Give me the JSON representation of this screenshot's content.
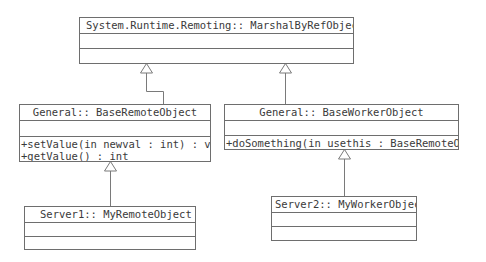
{
  "diagram": {
    "type": "uml-class-diagram",
    "classes": [
      {
        "id": "marshal",
        "name": "System.Runtime.Remoting:: MarshalByRefObject",
        "attributes": [],
        "operations": []
      },
      {
        "id": "base_remote",
        "name": "General:: BaseRemoteObject",
        "attributes": [],
        "operations": [
          "+setValue(in newval : int) : void",
          "+getValue() : int"
        ]
      },
      {
        "id": "base_worker",
        "name": "General:: BaseWorkerObject",
        "attributes": [],
        "operations": [
          "+doSomething(in usethis : BaseRemoteObject)"
        ]
      },
      {
        "id": "my_remote",
        "name": "Server1:: MyRemoteObject",
        "attributes": [],
        "operations": []
      },
      {
        "id": "my_worker",
        "name": "Server2:: MyWorkerObject",
        "attributes": [],
        "operations": []
      }
    ],
    "relationships": [
      {
        "type": "generalization",
        "from": "base_remote",
        "to": "marshal"
      },
      {
        "type": "generalization",
        "from": "base_worker",
        "to": "marshal"
      },
      {
        "type": "generalization",
        "from": "my_remote",
        "to": "base_remote"
      },
      {
        "type": "generalization",
        "from": "my_worker",
        "to": "base_worker"
      }
    ],
    "colors": {
      "line": "#6e6e6e",
      "text": "#3a3a3a",
      "background": "#ffffff"
    }
  }
}
